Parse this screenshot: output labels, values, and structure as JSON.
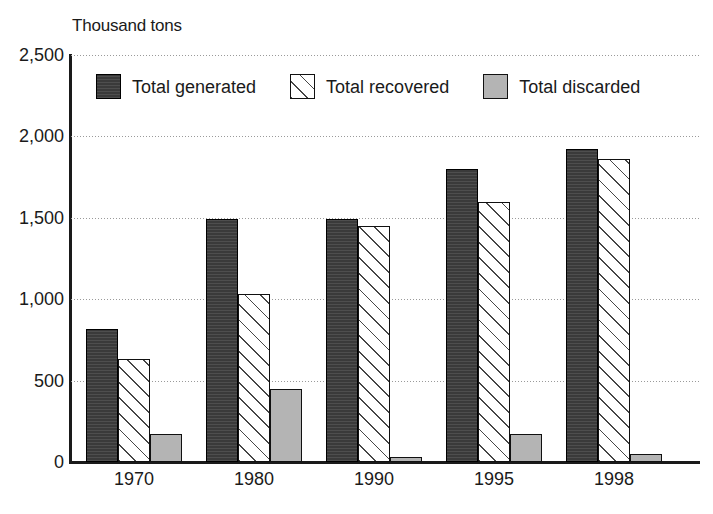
{
  "chart_data": {
    "type": "bar",
    "title": "",
    "subtitle": "",
    "xlabel": "",
    "ylabel": "Thousand tons",
    "ylim": [
      0,
      2500
    ],
    "ytick_labels": [
      "0",
      "500",
      "1,000",
      "1,500",
      "2,000",
      "2,500"
    ],
    "yticks": [
      0,
      500,
      1000,
      1500,
      2000,
      2500
    ],
    "grid": true,
    "legend_position": "top-inside",
    "categories": [
      "1970",
      "1980",
      "1990",
      "1995",
      "1998"
    ],
    "series": [
      {
        "name": "Total generated",
        "values": [
          820,
          1490,
          1495,
          1800,
          1920
        ],
        "color": "#3a3a3a",
        "pattern": "solid-dark"
      },
      {
        "name": "Total recovered",
        "values": [
          630,
          1035,
          1450,
          1600,
          1860
        ],
        "color": "#ffffff",
        "pattern": "diagonal-hatch"
      },
      {
        "name": "Total discarded",
        "values": [
          175,
          450,
          30,
          175,
          50
        ],
        "color": "#b4b4b4",
        "pattern": "solid-light-gray"
      }
    ]
  },
  "axis": {
    "y_title": "Thousand tons"
  },
  "legend": {
    "items": [
      {
        "label": "Total generated",
        "swatch": "dark-square-swatch"
      },
      {
        "label": "Total recovered",
        "swatch": "hatched-square-swatch"
      },
      {
        "label": "Total discarded",
        "swatch": "gray-square-swatch"
      }
    ]
  },
  "colors": {
    "generated": "#3a3a3a",
    "recovered": "#ffffff",
    "discarded": "#b4b4b4",
    "axis": "#1a1a1a",
    "grid": "#9a9a9a",
    "background": "#ffffff"
  }
}
